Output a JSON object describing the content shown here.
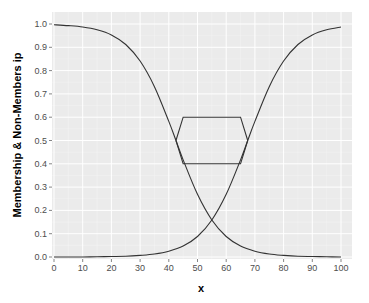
{
  "chart_data": {
    "type": "line",
    "title": "",
    "xlabel": "x",
    "ylabel": "Membership & Non-Members ip",
    "xlim": [
      0,
      100
    ],
    "ylim": [
      0,
      1
    ],
    "x_ticks": [
      0,
      10,
      20,
      30,
      40,
      50,
      60,
      70,
      80,
      90,
      100
    ],
    "y_ticks": [
      "0.0",
      "0.1",
      "0.2",
      "0.3",
      "0.4",
      "0.5",
      "0.6",
      "0.7",
      "0.8",
      "0.9",
      "1.0"
    ],
    "grid": true,
    "legend": "none",
    "theme": {
      "panel_bg": "#ebebeb",
      "grid_major": "#ffffff",
      "grid_minor": "#f5f5f5",
      "line_color": "#333333"
    },
    "series": [
      {
        "name": "membership-decreasing",
        "x": [
          0,
          5,
          10,
          15,
          20,
          25,
          30,
          35,
          40,
          42.5,
          45,
          50,
          55,
          60,
          65,
          70,
          75,
          80,
          85,
          90,
          95,
          100
        ],
        "y": [
          0.997,
          0.993,
          0.987,
          0.975,
          0.953,
          0.912,
          0.841,
          0.731,
          0.582,
          0.5,
          0.417,
          0.269,
          0.159,
          0.088,
          0.047,
          0.025,
          0.013,
          0.007,
          0.003,
          0.002,
          0.001,
          0.0
        ]
      },
      {
        "name": "membership-increasing",
        "x": [
          0,
          5,
          10,
          15,
          20,
          25,
          30,
          35,
          40,
          45,
          50,
          55,
          60,
          65,
          67.5,
          70,
          75,
          80,
          85,
          90,
          95,
          100
        ],
        "y": [
          0.0,
          0.0,
          0.0,
          0.001,
          0.002,
          0.003,
          0.007,
          0.013,
          0.025,
          0.047,
          0.088,
          0.159,
          0.269,
          0.417,
          0.5,
          0.582,
          0.731,
          0.841,
          0.912,
          0.953,
          0.975,
          0.987
        ]
      },
      {
        "name": "upper-bound",
        "x": [
          42.5,
          45,
          65,
          67.5
        ],
        "y": [
          0.5,
          0.6,
          0.6,
          0.5
        ]
      },
      {
        "name": "lower-bound",
        "x": [
          42.5,
          45,
          65,
          67.5
        ],
        "y": [
          0.5,
          0.4,
          0.4,
          0.5
        ]
      }
    ]
  }
}
